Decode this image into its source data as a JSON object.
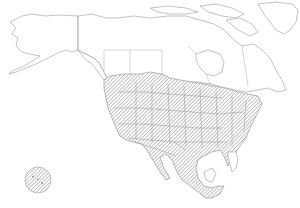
{
  "map": {
    "subject": "North America outline map",
    "regions_outlined": [
      "Alaska",
      "Canada",
      "Greenland",
      "United States",
      "Mexico",
      "Central America"
    ],
    "range_layer": {
      "pattern": "diagonal-hatch",
      "color": "#8a8a8a",
      "extent": "southern Canada, contiguous United States, Mexico"
    },
    "inset": {
      "shape": "circle",
      "pattern": "diagonal-hatch",
      "position": "lower-left",
      "depicts": "Hawaii"
    },
    "colors": {
      "background": "#ffffff",
      "outline": "#9a9a9a",
      "hatch": "#8a8a8a"
    }
  }
}
